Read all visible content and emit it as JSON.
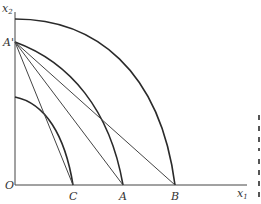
{
  "figure": {
    "axes": {
      "x_label": "x",
      "x_subscript": "1",
      "y_label": "x",
      "y_subscript": "2",
      "origin_label": "O"
    },
    "points": {
      "a_prime": "A'",
      "c": "C",
      "a": "A",
      "b": "B"
    },
    "curves": [
      {
        "name": "outer-arc",
        "from": "x2-axis (top)",
        "to": "B"
      },
      {
        "name": "middle-arc",
        "from": "A'",
        "to": "A"
      },
      {
        "name": "inner-arc",
        "from": "x2-axis (lower)",
        "to": "C"
      }
    ],
    "lines": [
      {
        "name": "line-a-prime-to-c",
        "from": "A'",
        "to": "C"
      },
      {
        "name": "line-a-prime-to-a",
        "from": "A'",
        "to": "A"
      },
      {
        "name": "line-a-prime-to-b",
        "from": "A'",
        "to": "B"
      }
    ]
  }
}
